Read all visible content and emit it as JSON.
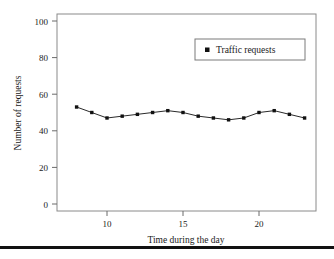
{
  "chart_data": {
    "type": "line",
    "title": "",
    "xlabel": "Time during the day",
    "ylabel": "Number of requests",
    "xlim": [
      7,
      24
    ],
    "ylim": [
      0,
      100
    ],
    "grid": false,
    "legend_position": "upper-right",
    "x": [
      8,
      9,
      10,
      11,
      12,
      13,
      14,
      15,
      16,
      17,
      18,
      19,
      20,
      21,
      22,
      23
    ],
    "series": [
      {
        "name": "Traffic requests",
        "marker": "square",
        "color": "#111111",
        "values": [
          53,
          50,
          47,
          48,
          49,
          50,
          51,
          50,
          48,
          47,
          46,
          47,
          50,
          51,
          49,
          47
        ]
      }
    ],
    "xticks": [
      10,
      15,
      20
    ],
    "xtick_labels": [
      "10",
      "15",
      "20"
    ],
    "yticks": [
      0,
      20,
      40,
      60,
      80,
      100
    ],
    "ytick_labels": [
      "0",
      "20",
      "40",
      "60",
      "80",
      "100"
    ]
  },
  "axes": {
    "y_title": "Number of requests",
    "x_title": "Time during the day"
  },
  "legend": {
    "entries": [
      {
        "label": "Traffic requests",
        "marker": "square-marker"
      }
    ]
  },
  "ticks": {
    "y": [
      "100",
      "80",
      "60",
      "40",
      "20",
      "0"
    ],
    "x": [
      "10",
      "15",
      "20"
    ]
  }
}
